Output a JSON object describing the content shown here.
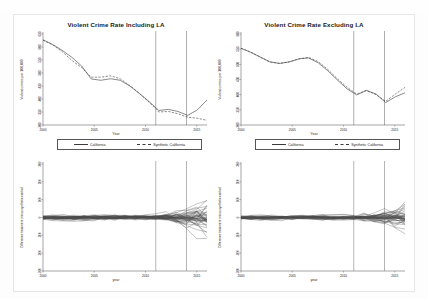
{
  "figure": {
    "background_color": "#ffffff",
    "frame_color": "#e6e6e6",
    "line_color": "#3a3a3a",
    "placebo_color": "#555555"
  },
  "panels": {
    "top_left": {
      "title": "Violent Crime Rate Including LA",
      "xlabel": "Year",
      "ylabel": "Violent crimes per 100,000",
      "legend": {
        "treated_label": "California",
        "synthetic_label": "Synthetic California"
      }
    },
    "top_right": {
      "title": "Violent Crime Rate Excluding LA",
      "xlabel": "Year",
      "ylabel": "Violent crimes per 100,000",
      "legend": {
        "treated_label": "California",
        "synthetic_label": "Synthetic California"
      }
    },
    "bottom_left": {
      "title": "",
      "xlabel": "year",
      "ylabel": "Difference treatment minus synthetic control"
    },
    "bottom_right": {
      "title": "",
      "xlabel": "year",
      "ylabel": "Difference treatment minus synthetic control"
    }
  },
  "chart_data": [
    {
      "id": "top_left",
      "type": "line",
      "title": "Violent Crime Rate Including LA",
      "xlabel": "Year",
      "ylabel": "Violent crimes per 100,000",
      "xlim": [
        2000,
        2016
      ],
      "ylim": [
        300,
        650
      ],
      "xticks": [
        2000,
        2005,
        2010,
        2015
      ],
      "yticks": [
        300,
        350,
        400,
        450,
        500,
        550,
        600,
        650
      ],
      "grid": false,
      "legend_position": "below",
      "vlines": [
        2011,
        2014
      ],
      "x": [
        2000,
        2001,
        2002,
        2003,
        2004,
        2005,
        2006,
        2007,
        2008,
        2009,
        2010,
        2011,
        2012,
        2013,
        2014,
        2015,
        2016
      ],
      "series": [
        {
          "name": "California",
          "style": "solid",
          "values": [
            628,
            610,
            587,
            560,
            527,
            477,
            472,
            478,
            472,
            450,
            421,
            390,
            356,
            360,
            352,
            337,
            358,
            396
          ]
        },
        {
          "name": "Synthetic California",
          "style": "dashed",
          "values": [
            626,
            608,
            582,
            548,
            521,
            484,
            484,
            489,
            478,
            452,
            421,
            388,
            350,
            352,
            343,
            330,
            326,
            318
          ]
        }
      ]
    },
    {
      "id": "top_right",
      "type": "line",
      "title": "Violent Crime Rate Excluding LA",
      "xlabel": "Year",
      "ylabel": "Violent crimes per 100,000",
      "xlim": [
        2000,
        2016
      ],
      "ylim": [
        300,
        600
      ],
      "xticks": [
        2000,
        2005,
        2010,
        2015
      ],
      "yticks": [
        300,
        350,
        400,
        450,
        500,
        550,
        600
      ],
      "grid": false,
      "legend_position": "below",
      "vlines": [
        2011,
        2014
      ],
      "x": [
        2000,
        2001,
        2002,
        2003,
        2004,
        2005,
        2006,
        2007,
        2008,
        2009,
        2010,
        2011,
        2012,
        2013,
        2014,
        2015,
        2016
      ],
      "series": [
        {
          "name": "California",
          "style": "solid",
          "values": [
            553,
            540,
            524,
            508,
            503,
            508,
            518,
            521,
            505,
            479,
            448,
            419,
            399,
            414,
            402,
            374,
            393,
            406
          ]
        },
        {
          "name": "Synthetic California",
          "style": "dashed",
          "values": [
            553,
            540,
            524,
            508,
            503,
            508,
            518,
            523,
            509,
            483,
            452,
            424,
            402,
            414,
            400,
            378,
            402,
            424
          ]
        }
      ]
    },
    {
      "id": "bottom_left",
      "type": "line",
      "title": "",
      "xlabel": "year",
      "ylabel": "Difference treatment minus synthetic control",
      "xlim": [
        2000,
        2016
      ],
      "ylim": [
        -300,
        300
      ],
      "xticks": [
        2000,
        2005,
        2010,
        2015
      ],
      "yticks": [
        -300,
        -200,
        -100,
        0,
        100,
        200,
        300
      ],
      "grid": false,
      "legend_position": "none",
      "vlines": [
        2011,
        2014
      ],
      "note": "placebo gap plot: many donor-unit difference series overlaid, tight around zero pre-2011 and fanning out after"
    },
    {
      "id": "bottom_right",
      "type": "line",
      "title": "",
      "xlabel": "year",
      "ylabel": "Difference treatment minus synthetic control",
      "xlim": [
        2000,
        2016
      ],
      "ylim": [
        -300,
        300
      ],
      "xticks": [
        2000,
        2005,
        2010,
        2015
      ],
      "yticks": [
        -300,
        -200,
        -100,
        0,
        100,
        200,
        300
      ],
      "grid": false,
      "legend_position": "none",
      "vlines": [
        2011,
        2014
      ],
      "note": "placebo gap plot: many donor-unit difference series overlaid, tight around zero pre-2011 and fanning out after"
    }
  ]
}
